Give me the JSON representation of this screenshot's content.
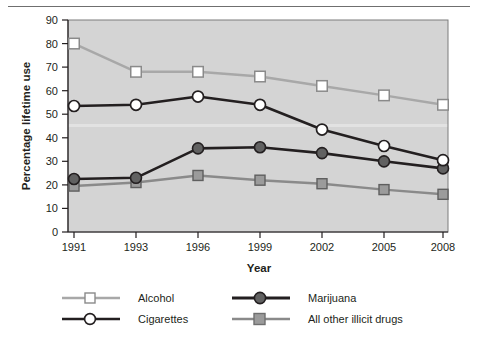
{
  "chart_data": {
    "type": "line",
    "title": "",
    "xlabel": "Year",
    "ylabel": "Percentage lifetime use",
    "categories": [
      "1991",
      "1993",
      "1996",
      "1999",
      "2002",
      "2005",
      "2008"
    ],
    "x": [
      1991,
      1993,
      1996,
      1999,
      2002,
      2005,
      2008
    ],
    "xlim": [
      1991,
      2008
    ],
    "ylim": [
      0,
      90
    ],
    "yticks": [
      0,
      10,
      20,
      30,
      40,
      50,
      60,
      70,
      80,
      90
    ],
    "ytick_labels": [
      "0",
      "10",
      "20",
      "30",
      "40",
      "50",
      "60",
      "70",
      "80",
      "90"
    ],
    "grid": false,
    "legend_position": "below",
    "series": [
      {
        "name": "Alcohol",
        "color": "#a8a8a8",
        "marker": "open-square",
        "marker_fill": "#ffffff",
        "values": [
          80,
          68,
          68,
          66,
          62,
          58,
          54
        ]
      },
      {
        "name": "Cigarettes",
        "color": "#231f20",
        "marker": "open-circle",
        "marker_fill": "#ffffff",
        "values": [
          53.5,
          54,
          57.5,
          54,
          43.5,
          36.5,
          30.5
        ]
      },
      {
        "name": "Marijuana",
        "color": "#231f20",
        "marker": "filled-circle",
        "marker_fill": "#616161",
        "values": [
          22.5,
          23,
          35.5,
          36,
          33.5,
          30,
          27
        ]
      },
      {
        "name": "All other illicit drugs",
        "color": "#8a8a8a",
        "marker": "filled-square",
        "marker_fill": "#9b9b9b",
        "values": [
          19.5,
          21,
          24,
          22,
          20.5,
          18,
          16
        ]
      }
    ]
  },
  "axes": {
    "x_title": "Year",
    "y_title": "Percentage lifetime use"
  },
  "legend": {
    "entries": [
      {
        "label": "Alcohol"
      },
      {
        "label": "Marijuana"
      },
      {
        "label": "Cigarettes"
      },
      {
        "label": "All other illicit drugs"
      }
    ]
  }
}
